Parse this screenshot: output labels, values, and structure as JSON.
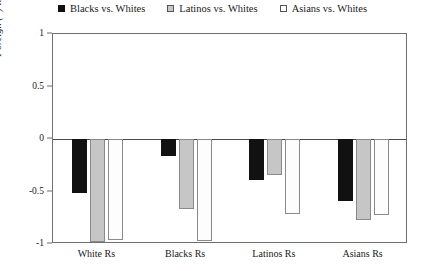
{
  "chart_data": {
    "type": "bar",
    "title": "",
    "xlabel": "",
    "ylabel": "Foreign (–) to American (+)",
    "ylim": [
      -1,
      1
    ],
    "yticks": [
      "1",
      "0.5",
      "0",
      "-0.5",
      "-1"
    ],
    "ytick_values": [
      1,
      0.5,
      0,
      -0.5,
      -1
    ],
    "grid": false,
    "legend_position": "top-center",
    "categories": [
      "White Rs",
      "Blacks Rs",
      "Latinos Rs",
      "Asians Rs"
    ],
    "series": [
      {
        "name": "Blacks vs. Whites",
        "marker": "filled-square",
        "color": "#111111",
        "values": [
          -0.51,
          -0.16,
          -0.39,
          -0.59
        ]
      },
      {
        "name": "Latinos vs. Whites",
        "marker": "gray-square",
        "color": "#c6c6c6",
        "values": [
          -0.98,
          -0.67,
          -0.34,
          -0.77
        ]
      },
      {
        "name": "Asians vs. Whites",
        "marker": "open-square",
        "color": "#fdfdfd",
        "values": [
          -0.96,
          -0.97,
          -0.71,
          -0.72
        ]
      }
    ]
  },
  "legend": {
    "items": [
      {
        "label": "Blacks vs. Whites"
      },
      {
        "label": "Latinos vs. Whites"
      },
      {
        "label": "Asians vs. Whites"
      }
    ]
  },
  "axes": {
    "y_label": "Foreign (–) to American (+)",
    "y_ticks": [
      "1",
      "0.5",
      "0",
      "-0.5",
      "-1"
    ],
    "x_ticks": [
      "White Rs",
      "Blacks Rs",
      "Latinos Rs",
      "Asians Rs"
    ]
  }
}
